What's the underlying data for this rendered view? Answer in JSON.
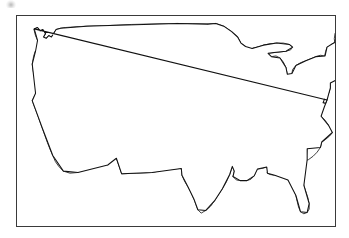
{
  "figure": {
    "type": "map",
    "description": "Black-and-white outline map of the contiguous United States enclosed in a thin rectangular border. The Pacific Northwest states of Washington and Oregon are filled with a gray halftone dither pattern; all other states are unfilled white.",
    "frame": {
      "visible": true,
      "border_color": "#3a3a3a",
      "border_width_px": 1,
      "x": 16,
      "y": 15,
      "width": 320,
      "height": 212
    },
    "artifact": {
      "name": "scan-speck",
      "description": "faint gray smudge from adjacent scanned page content",
      "x": 6,
      "y": 0
    }
  },
  "legend": {
    "visible": false,
    "entries": [
      {
        "label": "Highlighted",
        "pattern": "50% checkerboard dither",
        "color": "#808080"
      },
      {
        "label": "Not highlighted",
        "pattern": "solid fill",
        "color": "#ffffff"
      }
    ]
  },
  "colors": {
    "page_background": "#ffffff",
    "state_fill": "#ffffff",
    "state_outline": "#1c1c1c",
    "coastline_outline": "#111111",
    "highlight_fill": "#808080",
    "frame_border": "#3a3a3a"
  },
  "map_data": {
    "region": "Contiguous United States",
    "projection": "equal-area (approximate)",
    "highlighted_count": 2,
    "total_states_drawn": 49,
    "highlighted_states": [
      "Washington",
      "Oregon"
    ],
    "states": [
      {
        "code": "WA",
        "name": "Washington",
        "highlighted": true
      },
      {
        "code": "OR",
        "name": "Oregon",
        "highlighted": true
      },
      {
        "code": "CA",
        "name": "California",
        "highlighted": false
      },
      {
        "code": "NV",
        "name": "Nevada",
        "highlighted": false
      },
      {
        "code": "ID",
        "name": "Idaho",
        "highlighted": false
      },
      {
        "code": "MT",
        "name": "Montana",
        "highlighted": false
      },
      {
        "code": "WY",
        "name": "Wyoming",
        "highlighted": false
      },
      {
        "code": "UT",
        "name": "Utah",
        "highlighted": false
      },
      {
        "code": "AZ",
        "name": "Arizona",
        "highlighted": false
      },
      {
        "code": "CO",
        "name": "Colorado",
        "highlighted": false
      },
      {
        "code": "NM",
        "name": "New Mexico",
        "highlighted": false
      },
      {
        "code": "ND",
        "name": "North Dakota",
        "highlighted": false
      },
      {
        "code": "SD",
        "name": "South Dakota",
        "highlighted": false
      },
      {
        "code": "NE",
        "name": "Nebraska",
        "highlighted": false
      },
      {
        "code": "KS",
        "name": "Kansas",
        "highlighted": false
      },
      {
        "code": "OK",
        "name": "Oklahoma",
        "highlighted": false
      },
      {
        "code": "TX",
        "name": "Texas",
        "highlighted": false
      },
      {
        "code": "MN",
        "name": "Minnesota",
        "highlighted": false
      },
      {
        "code": "IA",
        "name": "Iowa",
        "highlighted": false
      },
      {
        "code": "MO",
        "name": "Missouri",
        "highlighted": false
      },
      {
        "code": "AR",
        "name": "Arkansas",
        "highlighted": false
      },
      {
        "code": "LA",
        "name": "Louisiana",
        "highlighted": false
      },
      {
        "code": "WI",
        "name": "Wisconsin",
        "highlighted": false
      },
      {
        "code": "IL",
        "name": "Illinois",
        "highlighted": false
      },
      {
        "code": "MS",
        "name": "Mississippi",
        "highlighted": false
      },
      {
        "code": "MI",
        "name": "Michigan",
        "highlighted": false
      },
      {
        "code": "IN",
        "name": "Indiana",
        "highlighted": false
      },
      {
        "code": "OH",
        "name": "Ohio",
        "highlighted": false
      },
      {
        "code": "KY",
        "name": "Kentucky",
        "highlighted": false
      },
      {
        "code": "TN",
        "name": "Tennessee",
        "highlighted": false
      },
      {
        "code": "AL",
        "name": "Alabama",
        "highlighted": false
      },
      {
        "code": "GA",
        "name": "Georgia",
        "highlighted": false
      },
      {
        "code": "FL",
        "name": "Florida",
        "highlighted": false
      },
      {
        "code": "SC",
        "name": "South Carolina",
        "highlighted": false
      },
      {
        "code": "NC",
        "name": "North Carolina",
        "highlighted": false
      },
      {
        "code": "VA",
        "name": "Virginia",
        "highlighted": false
      },
      {
        "code": "WV",
        "name": "West Virginia",
        "highlighted": false
      },
      {
        "code": "MD",
        "name": "Maryland",
        "highlighted": false
      },
      {
        "code": "DE",
        "name": "Delaware",
        "highlighted": false
      },
      {
        "code": "PA",
        "name": "Pennsylvania",
        "highlighted": false
      },
      {
        "code": "NJ",
        "name": "New Jersey",
        "highlighted": false
      },
      {
        "code": "NY",
        "name": "New York",
        "highlighted": false
      },
      {
        "code": "CT",
        "name": "Connecticut",
        "highlighted": false
      },
      {
        "code": "RI",
        "name": "Rhode Island",
        "highlighted": false
      },
      {
        "code": "MA",
        "name": "Massachusetts",
        "highlighted": false
      },
      {
        "code": "VT",
        "name": "Vermont",
        "highlighted": false
      },
      {
        "code": "NH",
        "name": "New Hampshire",
        "highlighted": false
      },
      {
        "code": "ME",
        "name": "Maine",
        "highlighted": false
      }
    ]
  }
}
